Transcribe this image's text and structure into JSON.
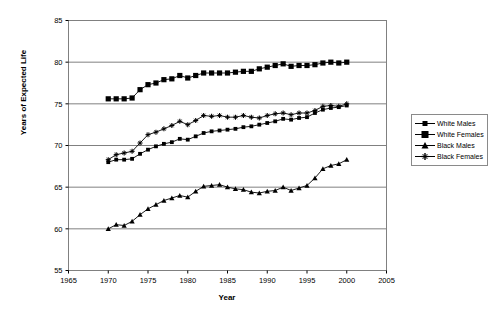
{
  "chart_data": {
    "type": "line",
    "title": "",
    "xlabel": "Year",
    "ylabel": "Years of Expected Life",
    "xlim": [
      1965,
      2005
    ],
    "ylim": [
      55,
      85
    ],
    "xticks": [
      1965,
      1970,
      1975,
      1980,
      1985,
      1990,
      1995,
      2000,
      2005
    ],
    "yticks": [
      55,
      60,
      65,
      70,
      75,
      80,
      85
    ],
    "grid": "horizontal",
    "legend_position": "right",
    "x": [
      1970,
      1971,
      1972,
      1973,
      1974,
      1975,
      1976,
      1977,
      1978,
      1979,
      1980,
      1981,
      1982,
      1983,
      1984,
      1985,
      1986,
      1987,
      1988,
      1989,
      1990,
      1991,
      1992,
      1993,
      1994,
      1995,
      1996,
      1997,
      1998,
      1999,
      2000
    ],
    "series": [
      {
        "name": "White Males",
        "marker": "small-square",
        "values": [
          68.0,
          68.3,
          68.3,
          68.4,
          69.0,
          69.5,
          69.9,
          70.2,
          70.4,
          70.8,
          70.7,
          71.1,
          71.5,
          71.7,
          71.8,
          71.9,
          72.0,
          72.2,
          72.3,
          72.5,
          72.7,
          72.9,
          73.2,
          73.1,
          73.3,
          73.4,
          73.9,
          74.3,
          74.5,
          74.6,
          74.8
        ]
      },
      {
        "name": "White Females",
        "marker": "large-square",
        "values": [
          75.6,
          75.6,
          75.6,
          75.7,
          76.7,
          77.3,
          77.5,
          77.9,
          78.0,
          78.4,
          78.1,
          78.4,
          78.7,
          78.7,
          78.7,
          78.7,
          78.8,
          78.9,
          78.9,
          79.2,
          79.4,
          79.6,
          79.8,
          79.5,
          79.6,
          79.6,
          79.7,
          79.9,
          80.0,
          79.9,
          80.0
        ]
      },
      {
        "name": "Black Males",
        "marker": "triangle",
        "values": [
          60.0,
          60.5,
          60.4,
          60.9,
          61.7,
          62.4,
          62.9,
          63.4,
          63.7,
          64.0,
          63.8,
          64.5,
          65.1,
          65.2,
          65.3,
          65.0,
          64.8,
          64.7,
          64.4,
          64.3,
          64.5,
          64.6,
          65.0,
          64.6,
          64.9,
          65.2,
          66.1,
          67.2,
          67.6,
          67.8,
          68.3
        ]
      },
      {
        "name": "Black Females",
        "marker": "cross",
        "values": [
          68.3,
          68.9,
          69.1,
          69.3,
          70.3,
          71.3,
          71.6,
          72.0,
          72.4,
          72.9,
          72.5,
          73.0,
          73.6,
          73.5,
          73.6,
          73.4,
          73.4,
          73.6,
          73.4,
          73.3,
          73.6,
          73.8,
          73.9,
          73.7,
          73.9,
          73.9,
          74.2,
          74.7,
          74.8,
          74.7,
          75.0
        ]
      }
    ]
  },
  "legend": {
    "items": [
      {
        "label": "White Males"
      },
      {
        "label": "White Females"
      },
      {
        "label": "Black Males"
      },
      {
        "label": "Black Females"
      }
    ]
  },
  "axes": {
    "y_title": "Years of Expected Life",
    "x_title": "Year"
  },
  "colors": {
    "series": "#000000",
    "grid": "#808080",
    "frame": "#808080",
    "background": "#ffffff"
  }
}
